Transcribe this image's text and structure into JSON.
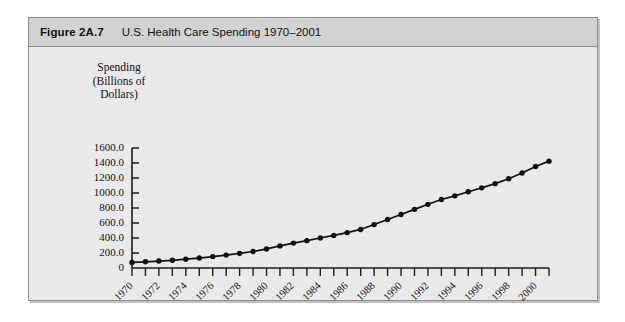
{
  "figure": {
    "number": "Figure 2A.7",
    "title": "U.S. Health Care Spending 1970–2001"
  },
  "axis_title": {
    "line1": "Spending",
    "line2": "(Billions of",
    "line3": "Dollars)"
  },
  "colors": {
    "panel_background": "#e9e9e9",
    "header_band": "#d2d2d2",
    "frame_border": "#8d8d8d",
    "axis": "#1a1a1a",
    "series": "#111111"
  },
  "chart_data": {
    "type": "line",
    "title": "U.S. Health Care Spending 1970–2001",
    "xlabel": "",
    "ylabel": "Spending (Billions of Dollars)",
    "ylim": [
      0,
      1600
    ],
    "xlim": [
      1970,
      2001
    ],
    "grid": false,
    "legend": null,
    "markers": true,
    "ytick_labels": [
      "1600.0",
      "1400.0",
      "1200.0",
      "1000.0",
      "800.0",
      "600.0",
      "400.0",
      "200.0",
      "0"
    ],
    "ytick_values": [
      1600,
      1400,
      1200,
      1000,
      800,
      600,
      400,
      200,
      0
    ],
    "xtick_labels": [
      "1970",
      "1972",
      "1974",
      "1976",
      "1978",
      "1980",
      "1982",
      "1984",
      "1986",
      "1988",
      "1990",
      "1992",
      "1994",
      "1996",
      "1998",
      "2000"
    ],
    "xtick_values": [
      1970,
      1972,
      1974,
      1976,
      1978,
      1980,
      1982,
      1984,
      1986,
      1988,
      1990,
      1992,
      1994,
      1996,
      1998,
      2000
    ],
    "x": [
      1970,
      1971,
      1972,
      1973,
      1974,
      1975,
      1976,
      1977,
      1978,
      1979,
      1980,
      1981,
      1982,
      1983,
      1984,
      1985,
      1986,
      1987,
      1988,
      1989,
      1990,
      1991,
      1992,
      1993,
      1994,
      1995,
      1996,
      1997,
      1998,
      1999,
      2000,
      2001
    ],
    "values": [
      74,
      83,
      93,
      103,
      117,
      133,
      152,
      172,
      194,
      220,
      254,
      295,
      332,
      365,
      400,
      435,
      472,
      514,
      579,
      647,
      714,
      782,
      849,
      913,
      962,
      1017,
      1069,
      1125,
      1190,
      1266,
      1353,
      1425
    ]
  }
}
